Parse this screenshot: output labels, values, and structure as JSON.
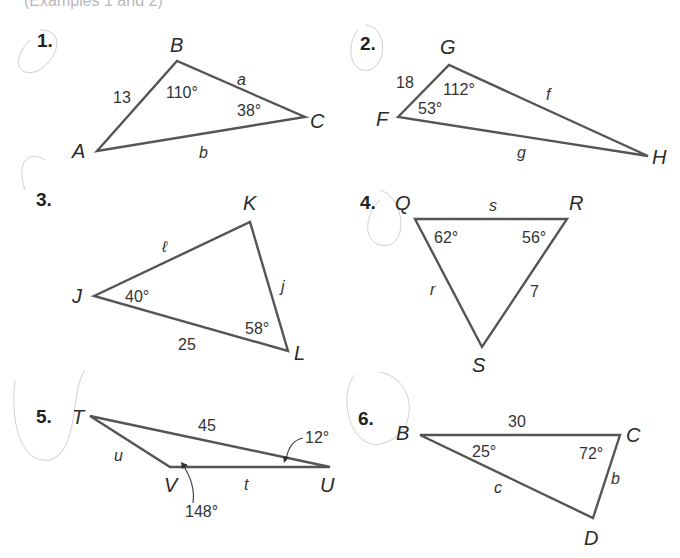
{
  "header": {
    "text": "(Examples 1 and 2)"
  },
  "problems": [
    {
      "number": "1.",
      "vertices": [
        "A",
        "B",
        "C"
      ],
      "sides": {
        "AB": "13",
        "BC": "a",
        "AC": "b"
      },
      "angles": {
        "B": "110°",
        "C": "38°"
      }
    },
    {
      "number": "2.",
      "vertices": [
        "F",
        "G",
        "H"
      ],
      "sides": {
        "FG": "18",
        "GH": "f",
        "FH": "g"
      },
      "angles": {
        "G": "112°",
        "F": "53°"
      }
    },
    {
      "number": "3.",
      "vertices": [
        "J",
        "K",
        "L"
      ],
      "sides": {
        "JK": "ℓ",
        "KL": "j",
        "JL": "25"
      },
      "angles": {
        "J": "40°",
        "L": "58°"
      }
    },
    {
      "number": "4.",
      "vertices": [
        "Q",
        "R",
        "S"
      ],
      "sides": {
        "QR": "s",
        "QS": "r",
        "RS": "7"
      },
      "angles": {
        "Q": "62°",
        "R": "56°"
      }
    },
    {
      "number": "5.",
      "vertices": [
        "T",
        "V",
        "U"
      ],
      "sides": {
        "TU": "45",
        "TV": "u",
        "VU": "t"
      },
      "angles": {
        "U": "12°",
        "V": "148°"
      }
    },
    {
      "number": "6.",
      "vertices": [
        "B",
        "C",
        "D"
      ],
      "sides": {
        "BC": "30",
        "CD": "b",
        "BD": "c"
      },
      "angles": {
        "B": "25°",
        "C": "72°"
      }
    }
  ]
}
